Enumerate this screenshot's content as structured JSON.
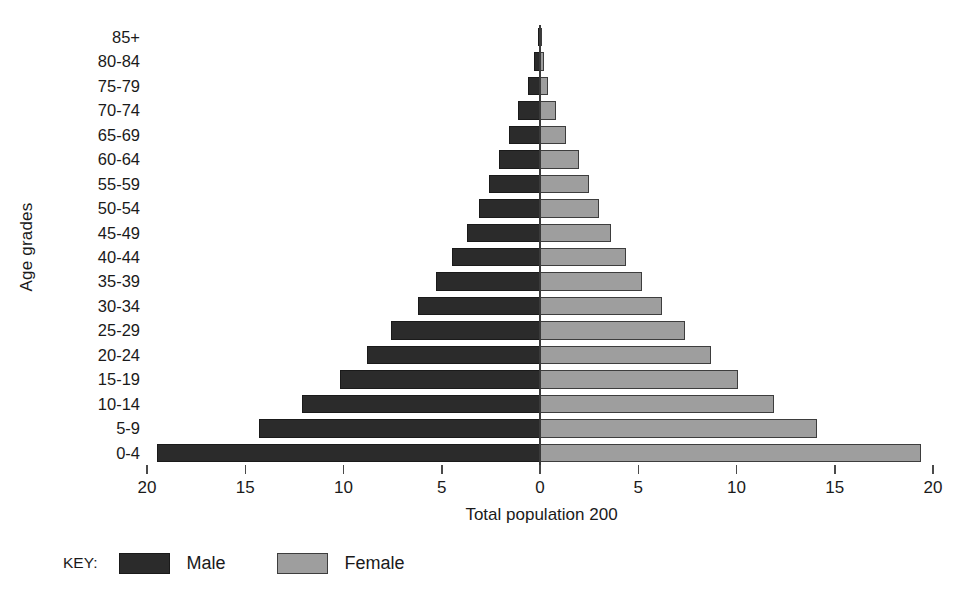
{
  "chart_data": {
    "type": "bar",
    "subtype": "population-pyramid",
    "title": "",
    "xlabel": "Total population 200",
    "ylabel": "Age grades",
    "categories": [
      "0-4",
      "5-9",
      "10-14",
      "15-19",
      "20-24",
      "25-29",
      "30-34",
      "35-39",
      "40-44",
      "45-49",
      "50-54",
      "55-59",
      "60-64",
      "65-69",
      "70-74",
      "75-79",
      "80-84",
      "85+"
    ],
    "series": [
      {
        "name": "Male",
        "color": "#2b2b2b",
        "values": [
          19.5,
          14.3,
          12.1,
          10.2,
          8.8,
          7.6,
          6.2,
          5.3,
          4.5,
          3.7,
          3.1,
          2.6,
          2.1,
          1.6,
          1.1,
          0.6,
          0.3,
          0.1
        ]
      },
      {
        "name": "Female",
        "color": "#9e9e9e",
        "values": [
          19.4,
          14.1,
          11.9,
          10.1,
          8.7,
          7.4,
          6.2,
          5.2,
          4.4,
          3.6,
          3.0,
          2.5,
          2.0,
          1.3,
          0.8,
          0.4,
          0.2,
          0.1
        ]
      }
    ],
    "xticks": [
      20,
      15,
      10,
      5,
      0,
      5,
      10,
      15,
      20
    ],
    "xlim": [
      -20,
      20
    ],
    "grid": false,
    "legend_position": "bottom-left"
  },
  "axes": {
    "y_title": "Age grades",
    "x_title": "Total population 200",
    "y_tick_labels": [
      "85+",
      "80-84",
      "75-79",
      "70-74",
      "65-69",
      "60-64",
      "55-59",
      "50-54",
      "45-49",
      "40-44",
      "35-39",
      "30-34",
      "25-29",
      "20-24",
      "15-19",
      "10-14",
      "5-9",
      "0-4"
    ],
    "x_tick_labels": [
      "20",
      "15",
      "10",
      "5",
      "0",
      "5",
      "10",
      "15",
      "20"
    ]
  },
  "legend": {
    "title": "KEY:",
    "entries": [
      {
        "label": "Male",
        "color": "#2b2b2b"
      },
      {
        "label": "Female",
        "color": "#9e9e9e"
      }
    ]
  }
}
